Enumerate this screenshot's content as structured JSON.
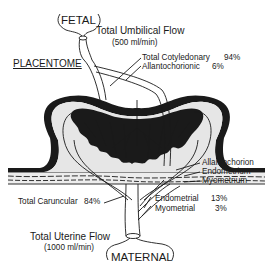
{
  "diagram": {
    "title": "PLACENTOME",
    "colors": {
      "ink": "#1a1a1a",
      "tissue": "#e6e6e6",
      "background": "#ffffff"
    },
    "fetal": {
      "label": "FETAL",
      "flow_title": "Total Umbilical Flow",
      "flow_value": "(500 ml/min)"
    },
    "umbilical_split": [
      {
        "label": "Total Cotyledonary",
        "value": "94%"
      },
      {
        "label": "Allantochorionic",
        "value": "6%"
      }
    ],
    "layers": [
      {
        "label": "Allantochorion"
      },
      {
        "label": "Endometrium"
      },
      {
        "label": "Myometrium"
      }
    ],
    "uterine_split": {
      "caruncular": {
        "label": "Total Caruncular",
        "value": "84%"
      },
      "endometrial": {
        "label": "Endometrial",
        "value": "13%"
      },
      "myometrial": {
        "label": "Myometrial",
        "value": "3%"
      }
    },
    "maternal": {
      "label": "MATERNAL",
      "flow_title": "Total Uterine Flow",
      "flow_value": "(1000 ml/min)"
    }
  }
}
